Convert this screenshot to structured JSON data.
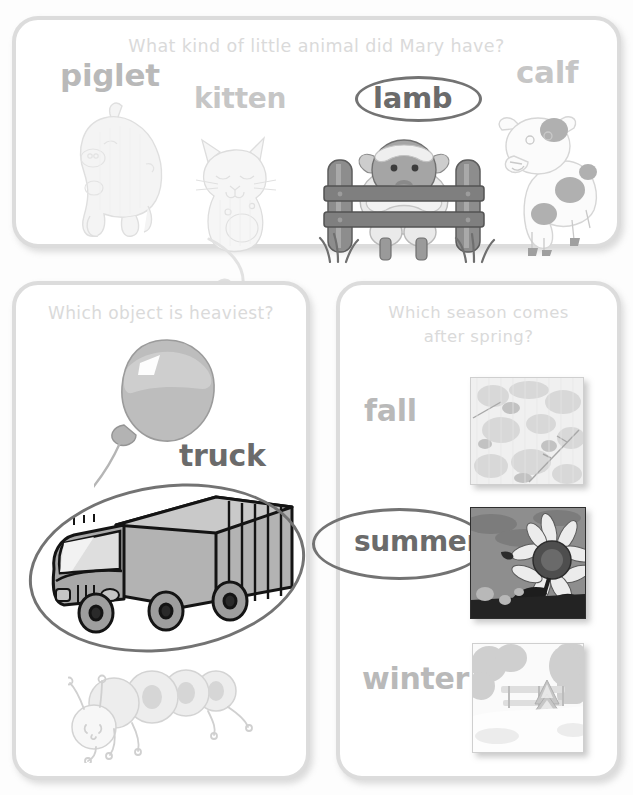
{
  "worksheet": {
    "title": "Picture quiz worksheet",
    "accent_circle_color": "#737373",
    "prompt_color": "#dadada",
    "word_color": "#b9b9b9",
    "selected_word_color": "#6b6b6b",
    "card_border_color": "#dcdcdc"
  },
  "cards": [
    {
      "id": "animals",
      "prompt": "What kind of little animal did Mary have?",
      "options": [
        {
          "label": "piglet",
          "picture": "piglet-illustration",
          "selected": false
        },
        {
          "label": "kitten",
          "picture": "kitten-illustration",
          "selected": false
        },
        {
          "label": "lamb",
          "picture": "lamb-at-fence-illustration",
          "selected": true
        },
        {
          "label": "calf",
          "picture": "calf-illustration",
          "selected": false
        }
      ],
      "answer": "lamb"
    },
    {
      "id": "heaviest",
      "prompt": "Which object is heaviest?",
      "options": [
        {
          "label": "",
          "picture": "balloon-illustration",
          "selected": false
        },
        {
          "label": "truck",
          "picture": "truck-illustration",
          "selected": true
        },
        {
          "label": "",
          "picture": "caterpillar-illustration",
          "selected": false
        }
      ],
      "answer": "truck"
    },
    {
      "id": "season",
      "prompt": "Which season comes\nafter spring?",
      "options": [
        {
          "label": "fall",
          "picture": "autumn-leaves-photo",
          "selected": false
        },
        {
          "label": "summer",
          "picture": "sunflower-photo",
          "selected": true
        },
        {
          "label": "winter",
          "picture": "snowy-pine-tree-photo",
          "selected": false
        }
      ],
      "answer": "summer"
    }
  ]
}
